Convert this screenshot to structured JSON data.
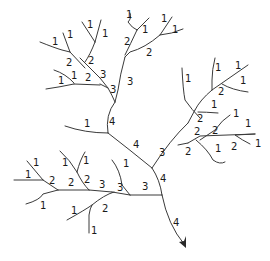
{
  "diagram": {
    "title": "",
    "colors": {
      "stroke": "#3a3a3a",
      "text": "#1a1a1a",
      "background": "#ffffff"
    },
    "outlet": {
      "icon": "arrow-head-icon"
    },
    "segments": [
      {
        "id": "trunk-top",
        "order": 4,
        "label": "4"
      },
      {
        "id": "trunk-mid",
        "order": 4,
        "label": "4"
      },
      {
        "id": "trunk-low",
        "order": 4,
        "label": "4"
      },
      {
        "id": "trunk-outlet",
        "order": 4,
        "label": "4"
      }
    ],
    "labels": [
      {
        "text": "1"
      },
      {
        "text": "1"
      },
      {
        "text": "1"
      },
      {
        "text": "1"
      },
      {
        "text": "2"
      },
      {
        "text": "2"
      },
      {
        "text": "1"
      },
      {
        "text": "1"
      },
      {
        "text": "2"
      },
      {
        "text": "3"
      },
      {
        "text": "3"
      },
      {
        "text": "1"
      },
      {
        "text": "1"
      },
      {
        "text": "2"
      },
      {
        "text": "1"
      },
      {
        "text": "1"
      },
      {
        "text": "2"
      },
      {
        "text": "3"
      },
      {
        "text": "4"
      },
      {
        "text": "1"
      },
      {
        "text": "4"
      },
      {
        "text": "1"
      },
      {
        "text": "1"
      },
      {
        "text": "1"
      },
      {
        "text": "2"
      },
      {
        "text": "1"
      },
      {
        "text": "1"
      },
      {
        "text": "2"
      },
      {
        "text": "1"
      },
      {
        "text": "2"
      },
      {
        "text": "1"
      },
      {
        "text": "2"
      },
      {
        "text": "2"
      },
      {
        "text": "1"
      },
      {
        "text": "2"
      },
      {
        "text": "1"
      },
      {
        "text": "3"
      },
      {
        "text": "1"
      },
      {
        "text": "1"
      },
      {
        "text": "1"
      },
      {
        "text": "2"
      },
      {
        "text": "1"
      },
      {
        "text": "1"
      },
      {
        "text": "2"
      },
      {
        "text": "2"
      },
      {
        "text": "3"
      },
      {
        "text": "1"
      },
      {
        "text": "3"
      },
      {
        "text": "3"
      },
      {
        "text": "1"
      },
      {
        "text": "2"
      },
      {
        "text": "1"
      },
      {
        "text": "4"
      },
      {
        "text": "4"
      }
    ]
  }
}
